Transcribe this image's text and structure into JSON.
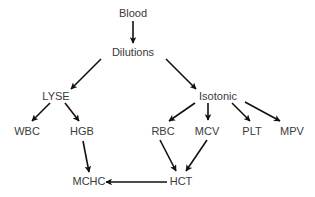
{
  "diagram": {
    "type": "flow",
    "colors": {
      "text": "#3a3a3a",
      "arrow": "#111111",
      "background": "#ffffff"
    },
    "nodes": {
      "blood": {
        "label": "Blood",
        "x": 133,
        "y": 13
      },
      "dilutions": {
        "label": "Dilutions",
        "x": 133,
        "y": 52
      },
      "lyse": {
        "label": "LYSE",
        "x": 56,
        "y": 96
      },
      "isotonic": {
        "label": "Isotonic",
        "x": 218,
        "y": 96
      },
      "wbc": {
        "label": "WBC",
        "x": 27,
        "y": 131
      },
      "hgb": {
        "label": "HGB",
        "x": 82,
        "y": 131
      },
      "rbc": {
        "label": "RBC",
        "x": 163,
        "y": 131
      },
      "mcv": {
        "label": "MCV",
        "x": 207,
        "y": 131
      },
      "plt": {
        "label": "PLT",
        "x": 252,
        "y": 131
      },
      "mpv": {
        "label": "MPV",
        "x": 292,
        "y": 131
      },
      "mchc": {
        "label": "MCHC",
        "x": 89,
        "y": 181
      },
      "hct": {
        "label": "HCT",
        "x": 181,
        "y": 181
      }
    },
    "edges": [
      {
        "from": "blood",
        "to": "dilutions"
      },
      {
        "from": "dilutions",
        "to": "lyse"
      },
      {
        "from": "dilutions",
        "to": "isotonic"
      },
      {
        "from": "lyse",
        "to": "wbc"
      },
      {
        "from": "lyse",
        "to": "hgb"
      },
      {
        "from": "isotonic",
        "to": "rbc"
      },
      {
        "from": "isotonic",
        "to": "mcv"
      },
      {
        "from": "isotonic",
        "to": "plt"
      },
      {
        "from": "isotonic",
        "to": "mpv"
      },
      {
        "from": "hgb",
        "to": "mchc"
      },
      {
        "from": "rbc",
        "to": "hct"
      },
      {
        "from": "mcv",
        "to": "hct"
      },
      {
        "from": "hct",
        "to": "mchc"
      }
    ]
  }
}
